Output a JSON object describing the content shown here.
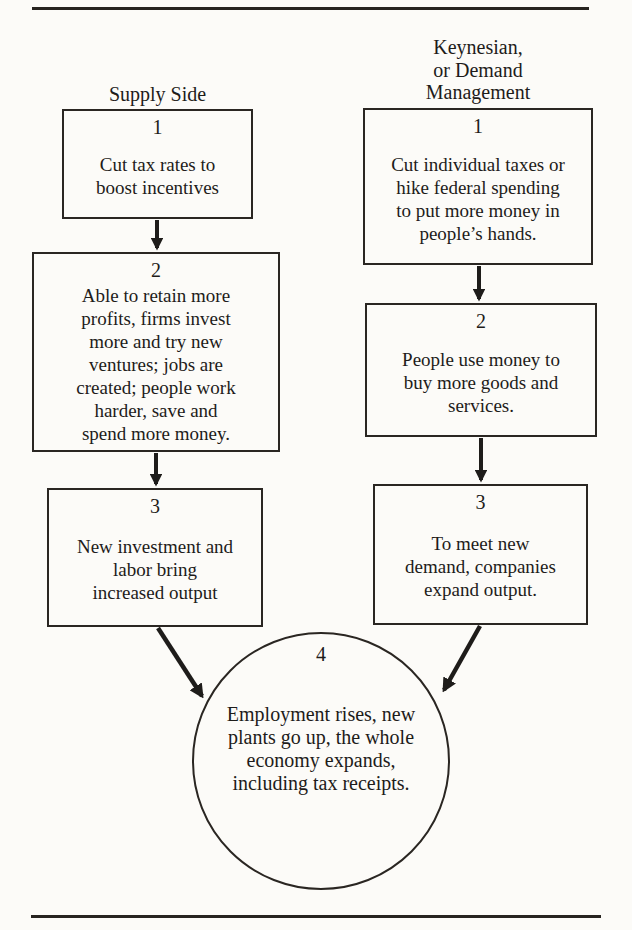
{
  "page": {
    "paper_color": "#fcfbf8",
    "ink_color": "#1e1c1a"
  },
  "columns": [
    {
      "id": "supply-side",
      "heading_lines": [
        "Supply Side"
      ],
      "boxes": [
        {
          "number": "1",
          "lines": [
            "Cut tax rates to",
            "boost incentives"
          ]
        },
        {
          "number": "2",
          "lines": [
            "Able to retain more",
            "profits, firms invest",
            "more and try new",
            "ventures; jobs are",
            "created; people work",
            "harder, save and",
            "spend more money."
          ]
        },
        {
          "number": "3",
          "lines": [
            "New investment and",
            "labor bring",
            "increased output"
          ]
        }
      ]
    },
    {
      "id": "keynesian-demand-management",
      "heading_lines": [
        "Keynesian,",
        "or Demand",
        "Management"
      ],
      "boxes": [
        {
          "number": "1",
          "lines": [
            "Cut individual taxes or",
            "hike federal spending",
            "to put more money in",
            "people’s hands."
          ]
        },
        {
          "number": "2",
          "lines": [
            "People use money to",
            "buy more goods and",
            "services."
          ]
        },
        {
          "number": "3",
          "lines": [
            "To meet new",
            "demand, companies",
            "expand output."
          ]
        }
      ]
    }
  ],
  "merge_node": {
    "number": "4",
    "lines": [
      "Employment rises, new",
      "plants go up, the whole",
      "economy expands,",
      "including tax receipts."
    ]
  }
}
